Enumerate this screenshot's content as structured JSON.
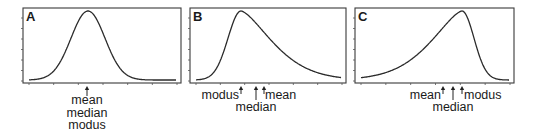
{
  "figure": {
    "panels": [
      {
        "id": "A",
        "label": "A",
        "shape": "symmetric",
        "frame": {
          "x": 23,
          "y": 8,
          "w": 158,
          "h": 75
        },
        "peak_x": 88,
        "skew": 0,
        "annotations": [
          {
            "x": 87,
            "lines": [
              "mean",
              "median",
              "modus"
            ],
            "arrow_len": 10,
            "text_x": 87,
            "anchor": "middle"
          }
        ]
      },
      {
        "id": "B",
        "label": "B",
        "shape": "right-skewed",
        "frame": {
          "x": 190,
          "y": 8,
          "w": 156,
          "h": 75
        },
        "peak_x": 241,
        "skew": 1,
        "annotations": [
          {
            "x": 241,
            "label": "modus",
            "arrow_len": 8,
            "text_x": 239,
            "text_y": 99,
            "anchor": "end"
          },
          {
            "x": 256,
            "label": "median",
            "arrow_len": 14,
            "text_x": 256,
            "text_y": 111,
            "anchor": "middle"
          },
          {
            "x": 264,
            "label": "mean",
            "arrow_len": 8,
            "text_x": 265,
            "text_y": 99,
            "anchor": "start"
          }
        ]
      },
      {
        "id": "C",
        "label": "C",
        "shape": "left-skewed",
        "frame": {
          "x": 355,
          "y": 8,
          "w": 159,
          "h": 75
        },
        "peak_x": 462,
        "skew": -1,
        "annotations": [
          {
            "x": 443,
            "label": "mean",
            "arrow_len": 8,
            "text_x": 441,
            "text_y": 99,
            "anchor": "end"
          },
          {
            "x": 453,
            "label": "median",
            "arrow_len": 14,
            "text_x": 453,
            "text_y": 111,
            "anchor": "middle"
          },
          {
            "x": 462,
            "label": "modus",
            "arrow_len": 8,
            "text_x": 464,
            "text_y": 99,
            "anchor": "start"
          }
        ]
      }
    ]
  },
  "chart_data": [
    {
      "type": "line",
      "title": "A",
      "description": "Symmetric distribution: mean = median = modus",
      "x": [
        0,
        1,
        2,
        3,
        4,
        5,
        6,
        7,
        8,
        9,
        10
      ],
      "values": [
        0.0,
        0.01,
        0.08,
        0.35,
        0.8,
        1.0,
        0.8,
        0.35,
        0.08,
        0.01,
        0.0
      ],
      "annotations": [
        "mean",
        "median",
        "modus"
      ],
      "xlabel": "",
      "ylabel": "",
      "grid": false
    },
    {
      "type": "line",
      "title": "B",
      "description": "Right-skewed distribution: modus < median < mean",
      "x": [
        0,
        1,
        2,
        3,
        4,
        5,
        6,
        7,
        8,
        9,
        10
      ],
      "values": [
        0.0,
        0.05,
        0.6,
        1.0,
        0.85,
        0.55,
        0.3,
        0.14,
        0.06,
        0.02,
        0.0
      ],
      "annotations": [
        "modus",
        "median",
        "mean"
      ],
      "xlabel": "",
      "ylabel": "",
      "grid": false
    },
    {
      "type": "line",
      "title": "C",
      "description": "Left-skewed distribution: mean < median < modus",
      "x": [
        0,
        1,
        2,
        3,
        4,
        5,
        6,
        7,
        8,
        9,
        10
      ],
      "values": [
        0.0,
        0.02,
        0.05,
        0.1,
        0.2,
        0.38,
        0.7,
        1.0,
        0.55,
        0.08,
        0.0
      ],
      "annotations": [
        "mean",
        "median",
        "modus"
      ],
      "xlabel": "",
      "ylabel": "",
      "grid": false
    }
  ]
}
